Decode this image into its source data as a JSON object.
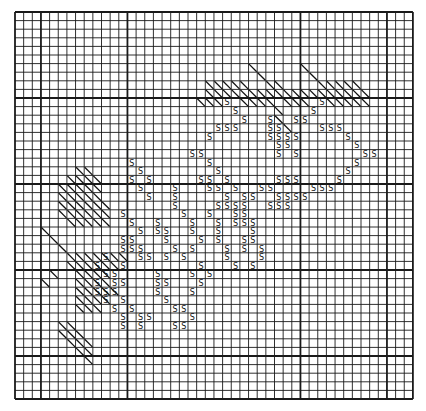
{
  "chart_data": {
    "type": "table",
    "title": "",
    "grid": {
      "cols": 46,
      "rows": 45,
      "origin_x": 15,
      "origin_y": 12,
      "cell_w": 8.65,
      "cell_h": 8.6,
      "heavy_cols": [
        0,
        3,
        13,
        33,
        43,
        46
      ],
      "heavy_rows": [
        0,
        10,
        20,
        30,
        40,
        45
      ],
      "line_color": "#1a1a1a",
      "background": "#ffffff"
    },
    "legend": [
      {
        "symbol": "S",
        "meaning": "stitch symbol S"
      },
      {
        "symbol": "\\",
        "meaning": "diagonal hatch stitch"
      }
    ],
    "symbols_S": [
      [
        10,
        24
      ],
      [
        11,
        25
      ],
      [
        12,
        26
      ],
      [
        13,
        23
      ],
      [
        13,
        24
      ],
      [
        13,
        25
      ],
      [
        14,
        22
      ],
      [
        16,
        21
      ],
      [
        16,
        20
      ],
      [
        17,
        22
      ],
      [
        18,
        23
      ],
      [
        19,
        13
      ],
      [
        19,
        24
      ],
      [
        20,
        14
      ],
      [
        20,
        25
      ],
      [
        20,
        28
      ],
      [
        21,
        15
      ],
      [
        21,
        26
      ],
      [
        21,
        27
      ],
      [
        10,
        35
      ],
      [
        11,
        34
      ],
      [
        12,
        33
      ],
      [
        13,
        35
      ],
      [
        13,
        36
      ],
      [
        13,
        37
      ],
      [
        14,
        38
      ],
      [
        15,
        39
      ],
      [
        16,
        40
      ],
      [
        16,
        41
      ],
      [
        17,
        39
      ],
      [
        18,
        38
      ],
      [
        19,
        37
      ],
      [
        20,
        36
      ],
      [
        20,
        35
      ],
      [
        20,
        34
      ],
      [
        21,
        33
      ],
      [
        21,
        32
      ],
      [
        22,
        31
      ],
      [
        12,
        29
      ],
      [
        13,
        29
      ],
      [
        13,
        30
      ],
      [
        14,
        29
      ],
      [
        14,
        30
      ],
      [
        14,
        31
      ],
      [
        15,
        30
      ],
      [
        15,
        31
      ],
      [
        16,
        30
      ],
      [
        12,
        32
      ],
      [
        14,
        32
      ],
      [
        16,
        32
      ],
      [
        19,
        30
      ],
      [
        19,
        31
      ],
      [
        19,
        32
      ],
      [
        20,
        29
      ],
      [
        21,
        30
      ],
      [
        21,
        31
      ],
      [
        22,
        30
      ],
      [
        22,
        29
      ],
      [
        19,
        21
      ],
      [
        19,
        22
      ],
      [
        20,
        22
      ],
      [
        20,
        23
      ],
      [
        21,
        24
      ],
      [
        22,
        23
      ],
      [
        22,
        24
      ],
      [
        17,
        13
      ],
      [
        18,
        14
      ],
      [
        19,
        15
      ],
      [
        20,
        18
      ],
      [
        21,
        18
      ],
      [
        22,
        18
      ],
      [
        23,
        19
      ],
      [
        24,
        20
      ],
      [
        25,
        20
      ],
      [
        26,
        21
      ],
      [
        27,
        20
      ],
      [
        28,
        19
      ],
      [
        24,
        16
      ],
      [
        25,
        16
      ],
      [
        25,
        17
      ],
      [
        26,
        17
      ],
      [
        27,
        18
      ],
      [
        28,
        17
      ],
      [
        22,
        25
      ],
      [
        23,
        25
      ],
      [
        24,
        26
      ],
      [
        24,
        27
      ],
      [
        25,
        27
      ],
      [
        26,
        27
      ],
      [
        27,
        28
      ],
      [
        28,
        28
      ],
      [
        29,
        27
      ],
      [
        23,
        22
      ],
      [
        24,
        23
      ],
      [
        25,
        23
      ],
      [
        26,
        23
      ],
      [
        27,
        24
      ],
      [
        28,
        24
      ],
      [
        29,
        25
      ],
      [
        22,
        26
      ],
      [
        23,
        26
      ],
      [
        24,
        25
      ],
      [
        26,
        26
      ],
      [
        27,
        26
      ],
      [
        23,
        12
      ],
      [
        24,
        13
      ],
      [
        25,
        14
      ],
      [
        26,
        13
      ],
      [
        26,
        12
      ],
      [
        27,
        12
      ],
      [
        27,
        13
      ],
      [
        27,
        14
      ],
      [
        28,
        14
      ],
      [
        28,
        15
      ],
      [
        29,
        12
      ],
      [
        30,
        11
      ],
      [
        31,
        11
      ],
      [
        31,
        12
      ],
      [
        32,
        11
      ],
      [
        33,
        12
      ],
      [
        34,
        13
      ],
      [
        35,
        14
      ],
      [
        35,
        15
      ],
      [
        36,
        14
      ],
      [
        30,
        16
      ],
      [
        31,
        16
      ],
      [
        31,
        17
      ],
      [
        32,
        16
      ],
      [
        33,
        17
      ],
      [
        34,
        18
      ],
      [
        34,
        19
      ],
      [
        35,
        20
      ],
      [
        36,
        19
      ],
      [
        36,
        18
      ],
      [
        29,
        21
      ],
      [
        30,
        22
      ],
      [
        31,
        21
      ],
      [
        32,
        20
      ],
      [
        30,
        20
      ],
      [
        29,
        9
      ],
      [
        30,
        10
      ],
      [
        31,
        9
      ],
      [
        32,
        9
      ],
      [
        32,
        10
      ],
      [
        28,
        10
      ],
      [
        33,
        10
      ],
      [
        34,
        11
      ],
      [
        35,
        12
      ],
      [
        36,
        12
      ]
    ],
    "symbols_hatch": [
      [
        6,
        27
      ],
      [
        6,
        33
      ],
      [
        7,
        28
      ],
      [
        7,
        34
      ],
      [
        8,
        22
      ],
      [
        8,
        23
      ],
      [
        8,
        24
      ],
      [
        8,
        25
      ],
      [
        8,
        26
      ],
      [
        8,
        29
      ],
      [
        8,
        30
      ],
      [
        8,
        35
      ],
      [
        8,
        36
      ],
      [
        8,
        37
      ],
      [
        8,
        38
      ],
      [
        8,
        39
      ],
      [
        9,
        22
      ],
      [
        9,
        23
      ],
      [
        9,
        24
      ],
      [
        9,
        25
      ],
      [
        9,
        26
      ],
      [
        9,
        27
      ],
      [
        9,
        28
      ],
      [
        9,
        29
      ],
      [
        9,
        30
      ],
      [
        9,
        31
      ],
      [
        9,
        32
      ],
      [
        9,
        33
      ],
      [
        9,
        34
      ],
      [
        9,
        35
      ],
      [
        9,
        36
      ],
      [
        9,
        37
      ],
      [
        9,
        38
      ],
      [
        9,
        39
      ],
      [
        9,
        40
      ],
      [
        10,
        21
      ],
      [
        10,
        22
      ],
      [
        10,
        23
      ],
      [
        10,
        26
      ],
      [
        10,
        27
      ],
      [
        10,
        28
      ],
      [
        10,
        29
      ],
      [
        10,
        31
      ],
      [
        10,
        32
      ],
      [
        10,
        33
      ],
      [
        10,
        36
      ],
      [
        10,
        37
      ],
      [
        10,
        38
      ],
      [
        10,
        39
      ],
      [
        10,
        40
      ],
      [
        11,
        30
      ],
      [
        12,
        30
      ],
      [
        13,
        31
      ],
      [
        18,
        7
      ],
      [
        18,
        8
      ],
      [
        19,
        6
      ],
      [
        19,
        7
      ],
      [
        19,
        8
      ],
      [
        19,
        9
      ],
      [
        20,
        5
      ],
      [
        20,
        6
      ],
      [
        20,
        7
      ],
      [
        20,
        8
      ],
      [
        20,
        9
      ],
      [
        21,
        5
      ],
      [
        21,
        6
      ],
      [
        21,
        7
      ],
      [
        21,
        8
      ],
      [
        21,
        9
      ],
      [
        22,
        5
      ],
      [
        22,
        6
      ],
      [
        22,
        7
      ],
      [
        22,
        8
      ],
      [
        22,
        9
      ],
      [
        22,
        10
      ],
      [
        23,
        5
      ],
      [
        23,
        6
      ],
      [
        23,
        7
      ],
      [
        23,
        8
      ],
      [
        23,
        9
      ],
      [
        23,
        10
      ],
      [
        24,
        6
      ],
      [
        24,
        7
      ],
      [
        24,
        8
      ],
      [
        24,
        9
      ],
      [
        24,
        10
      ],
      [
        25,
        3
      ],
      [
        26,
        4
      ],
      [
        27,
        5
      ],
      [
        28,
        6
      ],
      [
        28,
        7
      ],
      [
        28,
        8
      ],
      [
        28,
        9
      ],
      [
        28,
        10
      ],
      [
        28,
        11
      ],
      [
        28,
        12
      ],
      [
        29,
        6
      ],
      [
        29,
        7
      ],
      [
        29,
        8
      ],
      [
        29,
        9
      ],
      [
        29,
        10
      ],
      [
        29,
        11
      ],
      [
        30,
        4
      ],
      [
        30,
        7
      ],
      [
        30,
        8
      ],
      [
        30,
        9
      ],
      [
        30,
        10
      ],
      [
        31,
        3
      ],
      [
        31,
        7
      ],
      [
        31,
        8
      ],
      [
        31,
        9
      ],
      [
        31,
        10
      ],
      [
        32,
        7
      ],
      [
        32,
        8
      ],
      [
        32,
        9
      ],
      [
        32,
        10
      ],
      [
        32,
        11
      ],
      [
        33,
        7
      ],
      [
        33,
        8
      ],
      [
        33,
        9
      ],
      [
        33,
        10
      ],
      [
        34,
        7
      ],
      [
        34,
        8
      ],
      [
        34,
        9
      ],
      [
        36,
        5
      ],
      [
        36,
        6
      ],
      [
        37,
        5
      ],
      [
        37,
        6
      ],
      [
        37,
        7
      ],
      [
        38,
        6
      ],
      [
        38,
        7
      ],
      [
        38,
        8
      ],
      [
        39,
        7
      ],
      [
        39,
        8
      ],
      [
        40,
        8
      ]
    ]
  }
}
